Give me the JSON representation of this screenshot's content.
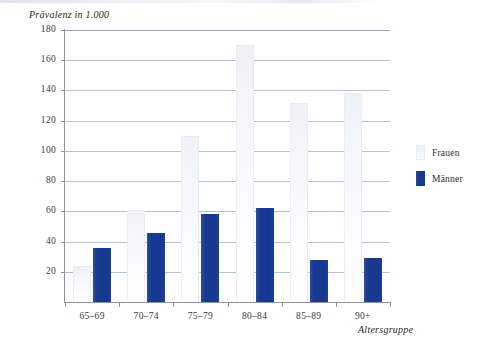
{
  "chart_data": {
    "type": "bar",
    "title": "",
    "xlabel": "Altersgruppe",
    "ylabel": "Prävalenz in 1.000",
    "categories": [
      "65–69",
      "70–74",
      "75–79",
      "80–84",
      "85–89",
      "90+"
    ],
    "series": [
      {
        "name": "Frauen",
        "color": "#f2f5fa",
        "values": [
          24,
          61,
          110,
          170,
          132,
          138
        ]
      },
      {
        "name": "Männer",
        "color": "#17398f",
        "values": [
          36,
          46,
          58,
          62,
          28,
          29
        ]
      }
    ],
    "ylim": [
      0,
      180
    ],
    "ytick_values": [
      20,
      40,
      60,
      80,
      100,
      120,
      140,
      160,
      180
    ],
    "ytick_labels": [
      "20",
      "40",
      "60",
      "80",
      "100",
      "120",
      "140",
      "160",
      "180"
    ],
    "grid": "horizontal",
    "grid_color": "#b4c2da",
    "legend_position": "right"
  },
  "legend": {
    "items": [
      {
        "label": "Frauen",
        "swatch": "light-blue-gradient-swatch"
      },
      {
        "label": "Männer",
        "swatch": "dark-blue-swatch"
      }
    ]
  },
  "axes": {
    "y_title": "Prävalenz in 1.000",
    "x_title": "Altersgruppe"
  }
}
